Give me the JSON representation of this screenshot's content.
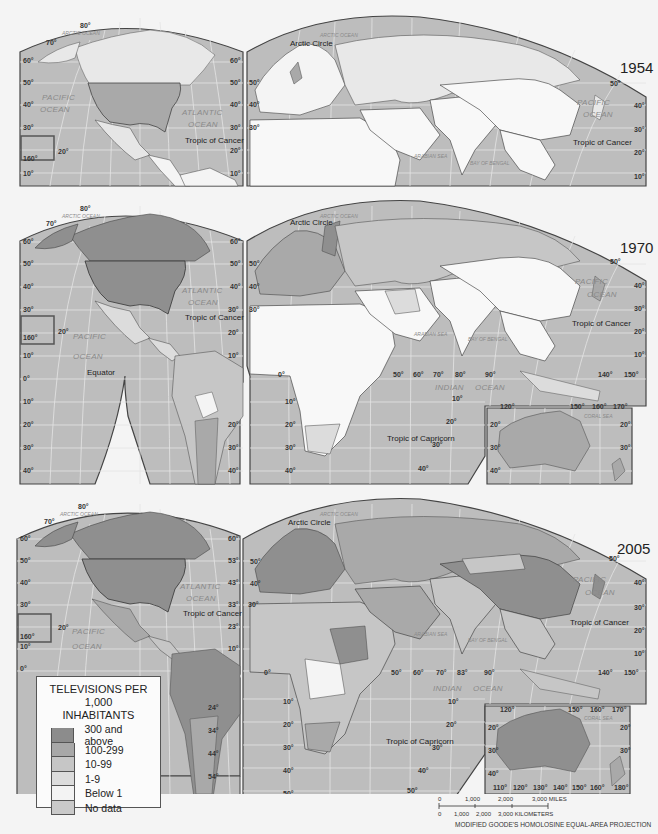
{
  "title": "Televisions per 1,000 inhabitants",
  "maps": [
    {
      "year": "1954",
      "top": 0
    },
    {
      "year": "1970",
      "top": 196
    },
    {
      "year": "2005",
      "top": 494
    }
  ],
  "labels": {
    "arctic_ocean": "ARCTIC OCEAN",
    "arctic_circle": "Arctic Circle",
    "pacific": "PACIFIC",
    "ocean": "OCEAN",
    "atlantic": "ATLANTIC",
    "tropic_cancer": "Tropic of Cancer",
    "tropic_capricorn": "Tropic of Capricorn",
    "equator": "Equator",
    "indian": "INDIAN",
    "arabian_sea": "ARABIAN SEA",
    "bay_of_bengal": "BAY OF BENGAL",
    "coral_sea": "CORAL SEA"
  },
  "latitude_ticks_left": [
    "60°",
    "50°",
    "40°",
    "30°",
    "20°",
    "10°",
    "0°",
    "10°",
    "20°",
    "30°",
    "40°",
    "50°"
  ],
  "longitude_ticks_south": [
    "0°",
    "50°",
    "60°",
    "70°",
    "80°",
    "90°",
    "140°",
    "150°"
  ],
  "australia_ticks_bottom": [
    "110°",
    "120°",
    "130°",
    "140°",
    "150°",
    "160°",
    "180°"
  ],
  "australia_ticks_top": [
    "120°",
    "150°",
    "160°",
    "170°"
  ],
  "legend": {
    "title_line1": "TELEVISIONS PER 1,000",
    "title_line2": "INHABITANTS",
    "items": [
      {
        "label": "300 and above",
        "color": "#8c8c8c"
      },
      {
        "label": "100-299",
        "color": "#a8a8a8"
      },
      {
        "label": "10-99",
        "color": "#c6c6c6"
      },
      {
        "label": "1-9",
        "color": "#dcdcdc"
      },
      {
        "label": "Below 1",
        "color": "#f3f3f3"
      },
      {
        "label": "No data",
        "color": "#c9c9c9"
      }
    ]
  },
  "scale": {
    "miles": [
      "0",
      "1,000",
      "2,000",
      "3,000 MILES"
    ],
    "km": [
      "0",
      "1,000",
      "2,000",
      "3,000 KILOMETERS"
    ]
  },
  "projection": "MODIFIED GOODE'S HOMOLOSINE EQUAL-AREA PROJECTION",
  "colors": {
    "ocean": "#b9b9b9",
    "grid": "#e6e6e6",
    "border": "#444444"
  }
}
